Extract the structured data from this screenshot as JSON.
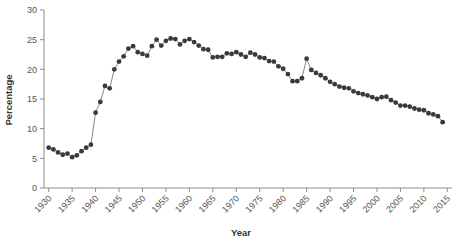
{
  "chart_data": {
    "type": "line",
    "title": "",
    "subtitle": "",
    "xlabel": "Year",
    "ylabel": "Percentage",
    "xlim": [
      1929,
      2016
    ],
    "ylim": [
      0,
      30
    ],
    "xticks": [
      1930,
      1935,
      1940,
      1945,
      1950,
      1955,
      1960,
      1965,
      1970,
      1975,
      1980,
      1985,
      1990,
      1995,
      2000,
      2005,
      2010,
      2015
    ],
    "xtick_labels": [
      "1930",
      "1935",
      "1940",
      "1945",
      "1950",
      "1955",
      "1960",
      "1965",
      "1970",
      "1975",
      "1980",
      "1985",
      "1990",
      "1995",
      "2000",
      "2005",
      "2010",
      "2015"
    ],
    "yticks": [
      0,
      5,
      10,
      15,
      20,
      25,
      30
    ],
    "ytick_labels": [
      "0",
      "5",
      "10",
      "15",
      "20",
      "25",
      "30"
    ],
    "grid": false,
    "legend": false,
    "legend_position": "none",
    "marker": "circle",
    "marker_color": "#3a3a3a",
    "line_color": "#555555",
    "axis_color": "#8c8c8c",
    "xtick_label_rotation": -45,
    "x": [
      1930,
      1931,
      1932,
      1933,
      1934,
      1935,
      1936,
      1937,
      1938,
      1939,
      1940,
      1941,
      1942,
      1943,
      1944,
      1945,
      1946,
      1947,
      1948,
      1949,
      1950,
      1951,
      1952,
      1953,
      1954,
      1955,
      1956,
      1957,
      1958,
      1959,
      1960,
      1961,
      1962,
      1963,
      1964,
      1965,
      1966,
      1967,
      1968,
      1969,
      1970,
      1971,
      1972,
      1973,
      1974,
      1975,
      1976,
      1977,
      1978,
      1979,
      1980,
      1981,
      1982,
      1983,
      1984,
      1985,
      1986,
      1987,
      1988,
      1989,
      1990,
      1991,
      1992,
      1993,
      1994,
      1995,
      1996,
      1997,
      1998,
      1999,
      2000,
      2001,
      2002,
      2003,
      2004,
      2005,
      2006,
      2007,
      2008,
      2009,
      2010,
      2011,
      2012,
      2013,
      2014
    ],
    "y": [
      6.8,
      6.5,
      6.0,
      5.6,
      5.8,
      5.2,
      5.5,
      6.2,
      6.8,
      7.3,
      12.7,
      14.5,
      17.2,
      16.8,
      20.0,
      21.3,
      22.2,
      23.5,
      23.9,
      22.9,
      22.6,
      22.3,
      23.9,
      25.0,
      24.0,
      24.8,
      25.2,
      25.1,
      24.2,
      24.8,
      25.1,
      24.6,
      24.0,
      23.4,
      23.3,
      22.0,
      22.1,
      22.1,
      22.7,
      22.6,
      22.9,
      22.5,
      22.1,
      22.8,
      22.5,
      22.0,
      21.9,
      21.4,
      21.3,
      20.5,
      20.1,
      19.2,
      18.0,
      18.0,
      18.5,
      21.8,
      19.9,
      19.4,
      19.0,
      18.5,
      17.9,
      17.5,
      17.1,
      16.9,
      16.8,
      16.3,
      16.0,
      15.8,
      15.6,
      15.3,
      15.0,
      15.3,
      15.4,
      14.8,
      14.4,
      13.9,
      13.9,
      13.7,
      13.4,
      13.2,
      13.1,
      12.6,
      12.4,
      12.1,
      11.1
    ],
    "n_points": 85
  }
}
